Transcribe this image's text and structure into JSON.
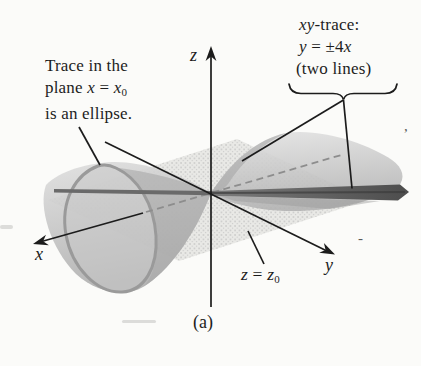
{
  "figure": {
    "caption": "(a)"
  },
  "annotations": {
    "ellipse_note": {
      "line1": "Trace in the",
      "line2_pre": "plane ",
      "line2_var1": "x",
      "line2_eq": " = ",
      "line2_var2": "x",
      "line2_sub": "0",
      "line3": "is an ellipse."
    },
    "xy_note": {
      "line1_var": "xy",
      "line1_rest": "-trace:",
      "line2_var1": "y",
      "line2_eq": " = ±4",
      "line2_var2": "x",
      "line3": "(two lines)"
    },
    "plane_note": {
      "var1": "z",
      "eq": " = ",
      "var2": "z",
      "sub": "0"
    }
  },
  "axes": {
    "x_label": "x",
    "y_label": "y",
    "z_label": "z"
  },
  "artifacts": {
    "comma_mark": ",",
    "dash_mark": "-"
  },
  "colors": {
    "ink": "#1c1c1c",
    "plane_fill": "#e9e9e6",
    "rim_gray": "#9a9a9a",
    "rim_fill": "#c9c9c9",
    "dash_gray": "#8d8d8d",
    "band_dark": "#555555",
    "band_left": "#6a6a6a"
  }
}
